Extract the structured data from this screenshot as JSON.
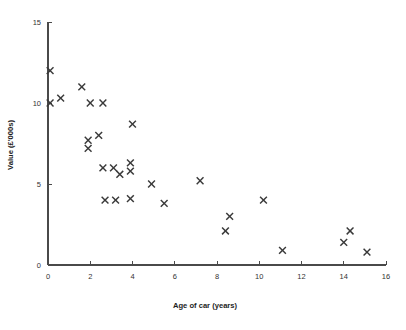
{
  "chart_data": {
    "type": "scatter",
    "title": "",
    "xlabel": "Age of car (years)",
    "ylabel": "Value (£'000s)",
    "xlim": [
      0,
      16
    ],
    "ylim": [
      0,
      15
    ],
    "xticks": [
      0,
      2,
      4,
      6,
      8,
      10,
      12,
      14,
      16
    ],
    "yticks": [
      0,
      5,
      10,
      15
    ],
    "xtick_labels": [
      "0",
      "2",
      "4",
      "6",
      "8",
      "10",
      "12",
      "14",
      "16"
    ],
    "ytick_labels": [
      "0",
      "5",
      "10",
      "15"
    ],
    "grid": false,
    "legend": false,
    "marker": "x",
    "marker_color": "#3a3a3a",
    "points": [
      {
        "x": 0.1,
        "y": 12.0
      },
      {
        "x": 0.1,
        "y": 10.0
      },
      {
        "x": 0.6,
        "y": 10.3
      },
      {
        "x": 1.6,
        "y": 11.0
      },
      {
        "x": 2.0,
        "y": 10.0
      },
      {
        "x": 2.6,
        "y": 10.0
      },
      {
        "x": 1.9,
        "y": 7.7
      },
      {
        "x": 1.9,
        "y": 7.2
      },
      {
        "x": 2.4,
        "y": 8.0
      },
      {
        "x": 4.0,
        "y": 8.7
      },
      {
        "x": 2.6,
        "y": 6.0
      },
      {
        "x": 3.1,
        "y": 6.0
      },
      {
        "x": 3.4,
        "y": 5.6
      },
      {
        "x": 3.9,
        "y": 6.3
      },
      {
        "x": 3.9,
        "y": 5.8
      },
      {
        "x": 2.7,
        "y": 4.0
      },
      {
        "x": 3.2,
        "y": 4.0
      },
      {
        "x": 3.9,
        "y": 4.1
      },
      {
        "x": 4.9,
        "y": 5.0
      },
      {
        "x": 5.5,
        "y": 3.8
      },
      {
        "x": 7.2,
        "y": 5.2
      },
      {
        "x": 8.4,
        "y": 2.1
      },
      {
        "x": 8.6,
        "y": 3.0
      },
      {
        "x": 10.2,
        "y": 4.0
      },
      {
        "x": 11.1,
        "y": 0.9
      },
      {
        "x": 14.0,
        "y": 1.4
      },
      {
        "x": 14.3,
        "y": 2.1
      },
      {
        "x": 15.1,
        "y": 0.8
      }
    ]
  }
}
